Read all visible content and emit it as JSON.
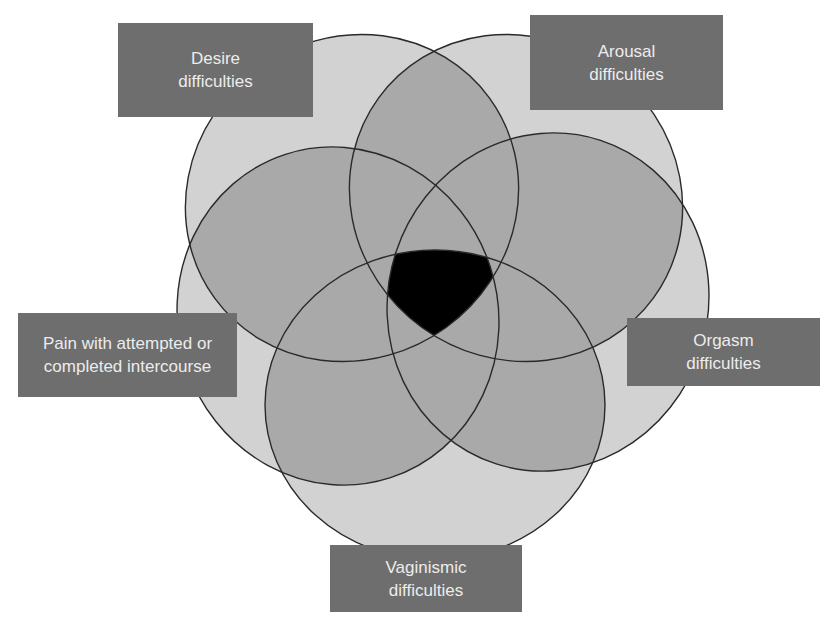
{
  "diagram": {
    "type": "five-set-venn",
    "colors": {
      "background": "#ffffff",
      "single_region": "#d2d2d2",
      "overlap_region": "#a9a9a9",
      "all_five_region": "#000000",
      "outline": "#2a2a2a",
      "label_box": "#6e6e6e",
      "label_text": "#ececec"
    },
    "sets": [
      {
        "id": "desire",
        "line1": "Desire",
        "line2": "difficulties"
      },
      {
        "id": "arousal",
        "line1": "Arousal",
        "line2": "difficulties"
      },
      {
        "id": "orgasm",
        "line1": "Orgasm",
        "line2": "difficulties"
      },
      {
        "id": "vaginismic",
        "line1": "Vaginismic",
        "line2": "difficulties"
      },
      {
        "id": "pain",
        "line1": "Pain with attempted or",
        "line2": "completed intercourse"
      }
    ],
    "center_region": "Overlap of all five difficulties"
  }
}
